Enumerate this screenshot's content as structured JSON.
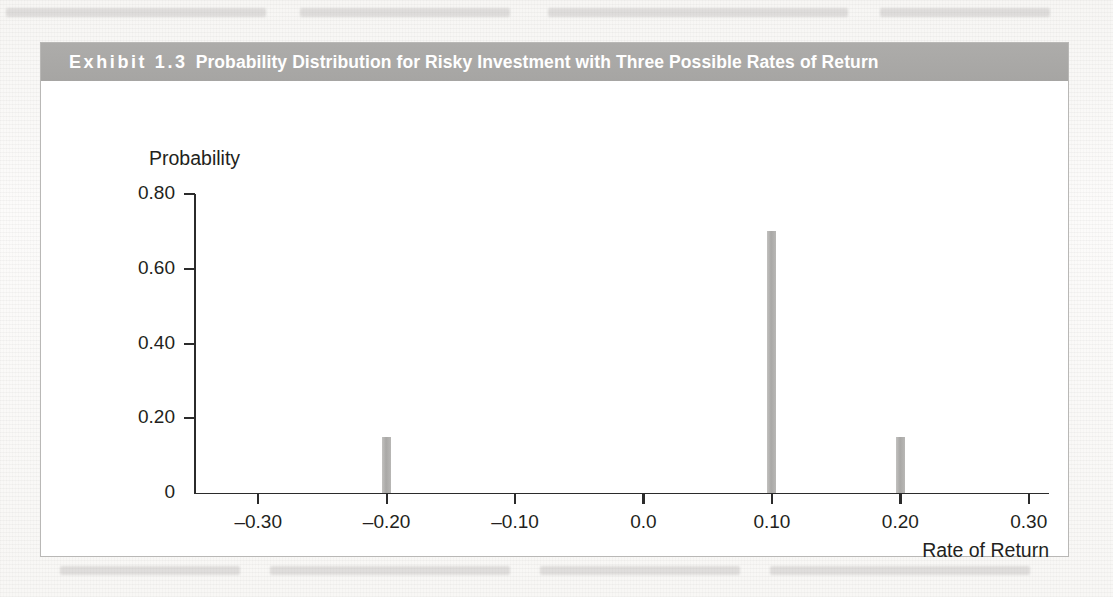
{
  "page": {
    "background_color": "#fbfbfa",
    "ghost_text_note": "faint show-through text from underlying book page"
  },
  "exhibit": {
    "label": "Exhibit 1.3",
    "title": "Probability Distribution for Risky Investment with Three Possible Rates of Return",
    "title_bar_color": "#a9a8a6",
    "title_text_color": "#ffffff",
    "frame_border_color": "#b9b8b6",
    "plot_background": "#ffffff"
  },
  "chart_data": {
    "type": "bar",
    "title": "Probability Distribution for Risky Investment with Three Possible Rates of Return",
    "xlabel": "Rate of Return",
    "ylabel": "Probability",
    "x": [
      -0.2,
      0.1,
      0.2
    ],
    "values": [
      0.15,
      0.7,
      0.15
    ],
    "categories": [
      "-0.20",
      "0.10",
      "0.20"
    ],
    "xlim": [
      -0.35,
      0.315
    ],
    "ylim": [
      0,
      0.8
    ],
    "xticks": [
      -0.3,
      -0.2,
      -0.1,
      0.0,
      0.1,
      0.2,
      0.3
    ],
    "xtick_labels": [
      "–0.30",
      "–0.20",
      "–0.10",
      "0.0",
      "0.10",
      "0.20",
      "0.30"
    ],
    "yticks": [
      0,
      0.2,
      0.4,
      0.6,
      0.8
    ],
    "ytick_labels": [
      "0",
      "0.20",
      "0.40",
      "0.60",
      "0.80"
    ],
    "grid": false,
    "legend": false,
    "bar_color": "#b4b3b1",
    "axis_color": "#2b2b2b",
    "bar_width_px": 9
  }
}
